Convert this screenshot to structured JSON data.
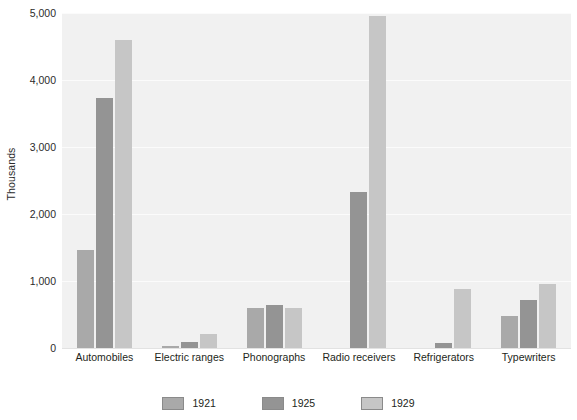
{
  "chart_data": {
    "type": "bar",
    "title": "",
    "subtitle": "",
    "xlabel": "",
    "ylabel": "Thousands",
    "ylim": [
      0,
      5000
    ],
    "ytick_labels": [
      "0",
      "1,000",
      "2,000",
      "3,000",
      "4,000",
      "5,000"
    ],
    "ytick_values": [
      0,
      1000,
      2000,
      3000,
      4000,
      5000
    ],
    "grid": true,
    "legend_position": "bottom",
    "categories": [
      "Automobiles",
      "Electric ranges",
      "Phonographs",
      "Radio receivers",
      "Refrigerators",
      "Typewriters"
    ],
    "series": [
      {
        "name": "1921",
        "color": "#a9a9a9",
        "values": [
          1465,
          30,
          595,
          0,
          5,
          480
        ]
      },
      {
        "name": "1925",
        "color": "#949494",
        "values": [
          3730,
          90,
          640,
          2330,
          75,
          720
        ]
      },
      {
        "name": "1929",
        "color": "#c6c6c6",
        "values": [
          4590,
          215,
          590,
          4950,
          880,
          950
        ]
      }
    ]
  },
  "legend": {
    "items": [
      {
        "label": "1921",
        "color": "#a9a9a9"
      },
      {
        "label": "1925",
        "color": "#949494"
      },
      {
        "label": "1929",
        "color": "#c6c6c6"
      }
    ]
  },
  "colors": {
    "plot_background": "#f1f1f1",
    "gridline": "#fbfbfb",
    "page_background": "#ffffff",
    "text": "#231f20"
  }
}
